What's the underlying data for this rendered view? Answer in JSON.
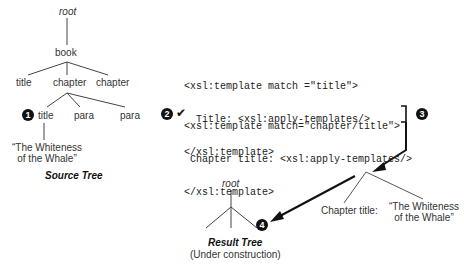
{
  "source_tree": {
    "caption": "Source Tree",
    "nodes": {
      "root": "root",
      "book": "book",
      "title1": "title",
      "chapter1": "chapter",
      "chapter2": "chapter",
      "title2": "title",
      "para1": "para",
      "para2": "para",
      "text_line1": "“The Whiteness",
      "text_line2": "of the Whale”"
    }
  },
  "templates": {
    "t1_line1": "<xsl:template match =\"title\">",
    "t1_line2": "  Title: <xsl:apply-templates/>",
    "t1_line3": "</xsl:template>",
    "t2_line1": "<xsl:template match=\"chapter/title\">",
    "t2_line2": " Chapter title: <xsl:apply-templates/>",
    "t2_line3": "</xsl:template>"
  },
  "fragment": {
    "chapter_title": "Chapter title:",
    "text_line1": "“The Whiteness",
    "text_line2": "of the Whale”"
  },
  "result_tree": {
    "root": "root",
    "caption": "Result Tree",
    "subcaption": "(Under construction)"
  },
  "markers": {
    "m1": "1",
    "m2": "2",
    "m3": "3",
    "m4": "4",
    "check": "✔"
  }
}
